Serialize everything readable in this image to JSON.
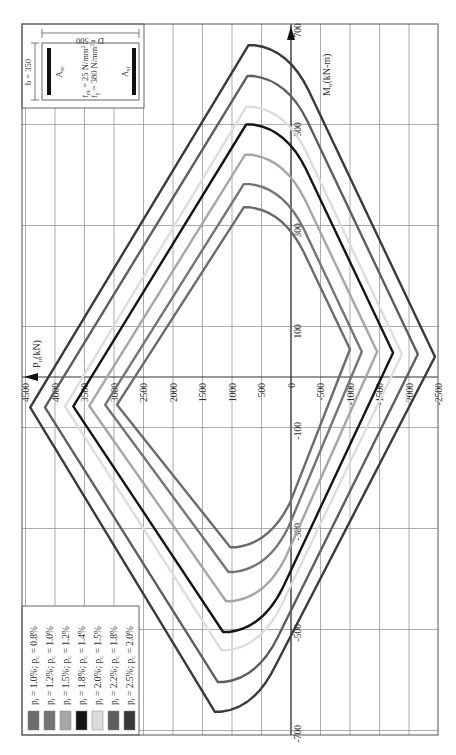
{
  "chart_data": {
    "type": "line",
    "title": "",
    "orientation": "rotated 90° counter-clockwise",
    "xlabel": "P_u (kN)",
    "ylabel": "M_u (kN-m)",
    "x_axis_name": "Pu",
    "x_unit": "(kN)",
    "y_axis_name": "Mu",
    "y_unit": "(kN-m)",
    "xlim": [
      4500,
      -2500
    ],
    "ylim": [
      -700,
      700
    ],
    "grid": true,
    "x_ticks": [
      4500,
      4000,
      3500,
      3000,
      2500,
      2000,
      1500,
      1000,
      500,
      0,
      -500,
      -1000,
      -1500,
      -2000,
      -2500
    ],
    "x_tick_labels": [
      "4500",
      "4000",
      "3500",
      "3000",
      "2500",
      "2000",
      "1500",
      "1000",
      "500",
      "0",
      "-500",
      "-1000",
      "-1500",
      "-2000",
      "-2500"
    ],
    "y_ticks": [
      700,
      500,
      300,
      100,
      -100,
      -300,
      -500,
      -700
    ],
    "y_tick_labels": [
      "700",
      "500",
      "300",
      "100",
      "-100",
      "-300",
      "-500",
      "-700"
    ],
    "legend_position": "bottom-left",
    "series": [
      {
        "name": "pt = 1.0%; pc = 0.8%",
        "pt": "1.0%",
        "pc": "0.8%",
        "color": "#6b6b6b",
        "points": {
          "max_compression": [
            2950,
            -55
          ],
          "balanced_top": [
            800,
            336
          ],
          "max_tension": [
            -1000,
            55
          ],
          "balanced_bottom": [
            1030,
            -337
          ]
        }
      },
      {
        "name": "pt = 1.2%; pc = 1.0%",
        "pt": "1.2%",
        "pc": "1.0%",
        "color": "#747474",
        "points": {
          "max_compression": [
            3150,
            -55
          ],
          "balanced_top": [
            800,
            382
          ],
          "max_tension": [
            -1200,
            50
          ],
          "balanced_bottom": [
            1060,
            -386
          ]
        }
      },
      {
        "name": "pt = 1.5%; pc = 1.2%",
        "pt": "1.5%",
        "pc": "1.2%",
        "color": "#a6a6a6",
        "points": {
          "max_compression": [
            3420,
            -57
          ],
          "balanced_top": [
            780,
            440
          ],
          "max_tension": [
            -1460,
            50
          ],
          "balanced_bottom": [
            1100,
            -444
          ]
        }
      },
      {
        "name": "pt = 1.8%; pc = 1.4%",
        "pt": "1.8%",
        "pc": "1.4%",
        "color": "#151515",
        "points": {
          "max_compression": [
            3690,
            -58
          ],
          "balanced_top": [
            760,
            500
          ],
          "max_tension": [
            -1730,
            48
          ],
          "balanced_bottom": [
            1150,
            -505
          ]
        }
      },
      {
        "name": "pt = 2.0%; pc = 1.5%",
        "pt": "2.0%",
        "pc": "1.5%",
        "color": "#dddddd",
        "points": {
          "max_compression": [
            3830,
            -58
          ],
          "balanced_top": [
            760,
            535
          ],
          "max_tension": [
            -1880,
            45
          ],
          "balanced_bottom": [
            1180,
            -541
          ]
        }
      },
      {
        "name": "pt = 2.2%; pc = 1.8%",
        "pt": "2.2%",
        "pc": "1.8%",
        "color": "#5e5e5e",
        "points": {
          "max_compression": [
            4170,
            -60
          ],
          "balanced_top": [
            740,
            596
          ],
          "max_tension": [
            -2150,
            45
          ],
          "balanced_bottom": [
            1240,
            -604
          ]
        }
      },
      {
        "name": "pt = 2.5%; pc = 2.0%",
        "pt": "2.5%",
        "pc": "2.0%",
        "color": "#3a3a3a",
        "points": {
          "max_compression": [
            4420,
            -60
          ],
          "balanced_top": [
            720,
            657
          ],
          "max_tension": [
            -2440,
            40
          ],
          "balanced_bottom": [
            1290,
            -663
          ]
        }
      }
    ],
    "annotations": {
      "section_width": "b = 350",
      "section_depth": "D = 500",
      "fck": "f_ck = 25 N/mm²",
      "fy": "f_y = 380 N/mm²",
      "steel_compression": "A_sc",
      "steel_tension": "A_st"
    }
  },
  "axis": {
    "p_label_main": "P",
    "p_label_sub": "u",
    "p_label_unit": "(kN)",
    "m_label_main": "M",
    "m_label_sub": "u",
    "m_label_unit": "(kN-m)"
  },
  "inset": {
    "b_label": "b = 350",
    "d_label": "D = 500",
    "fck_label": "f",
    "fck_sub": "ck",
    "fck_value": " = 25 N/mm",
    "fy_label": "f",
    "fy_sub": "y",
    "fy_value": " = 380 N/mm",
    "sq": "2",
    "asc_main": "A",
    "asc_sub": "sc",
    "ast_main": "A",
    "ast_sub": "st"
  }
}
